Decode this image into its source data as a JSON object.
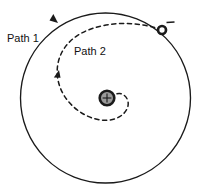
{
  "figure": {
    "background_color": "#ffffff",
    "width": 198,
    "height": 196,
    "stroke_color": "#1a1a1a",
    "labels": {
      "path1": "Path 1",
      "path2": "Path 2"
    },
    "charges": {
      "center": {
        "symbol": "+",
        "name": "positive-point-charge",
        "cx": 107,
        "cy": 98,
        "radius": 7.5,
        "ring_color": "#1a1a1a",
        "fill_color": "#9a9a9a"
      },
      "particle": {
        "symbol": "–",
        "name": "negative-particle",
        "cx": 162,
        "cy": 30,
        "radius": 4.2,
        "ring_color": "#1a1a1a",
        "fill_color": "#ffffff"
      }
    },
    "paths": [
      {
        "id": "path1",
        "label": "Path 1",
        "style": "solid",
        "shape": "circle",
        "cx": 105.5,
        "cy": 98,
        "r": 85,
        "direction": "counterclockwise"
      },
      {
        "id": "path2",
        "label": "Path 2",
        "style": "dashed",
        "shape": "inward-spiral",
        "direction": "counterclockwise",
        "start": [
          162,
          30
        ],
        "end": [
          116,
          110
        ]
      }
    ],
    "arrows": [
      {
        "name": "path1-direction-arrow",
        "x": 58,
        "y": 23,
        "angle": 222
      },
      {
        "name": "path2-direction-arrow",
        "x": 59,
        "y": 70,
        "angle": 104
      }
    ]
  }
}
